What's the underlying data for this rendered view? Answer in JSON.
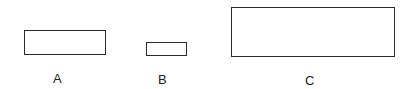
{
  "diagram": {
    "shapes": [
      {
        "id": "A",
        "label": "A",
        "type": "rectangle",
        "x": 24,
        "y": 30,
        "width": 82,
        "height": 25
      },
      {
        "id": "B",
        "label": "B",
        "type": "rectangle",
        "x": 146,
        "y": 42,
        "width": 41,
        "height": 14
      },
      {
        "id": "C",
        "label": "C",
        "type": "rectangle",
        "x": 231,
        "y": 7,
        "width": 164,
        "height": 50
      }
    ],
    "colors": {
      "stroke": "#2a2a2a",
      "background": "#ffffff",
      "text": "#222222"
    }
  }
}
